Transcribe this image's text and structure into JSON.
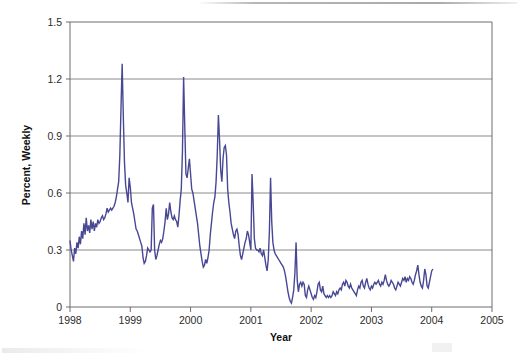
{
  "chart_data": {
    "type": "line",
    "title": "",
    "xlabel": "Year",
    "ylabel": "Percent, Weekly",
    "xlim": [
      1998.0,
      2005.0
    ],
    "ylim": [
      0,
      1.5
    ],
    "xticks": [
      1998,
      1999,
      2000,
      2001,
      2002,
      2003,
      2004,
      2005
    ],
    "xtick_labels": [
      "1998",
      "1999",
      "2000",
      "2001",
      "2002",
      "2003",
      "2004",
      "2005"
    ],
    "yticks": [
      0,
      0.3,
      0.6,
      0.9,
      1.2,
      1.5
    ],
    "ytick_labels": [
      "0",
      "0.3",
      "0.6",
      "0.9",
      "1.2",
      "1.5"
    ],
    "grid": "horizontal",
    "legend": "none",
    "series": [
      {
        "name": "Percent, Weekly",
        "color": "#474794",
        "x_start": 1998.0,
        "x_step": 0.019230769,
        "values": [
          0.35,
          0.3,
          0.27,
          0.24,
          0.31,
          0.28,
          0.34,
          0.31,
          0.37,
          0.33,
          0.4,
          0.36,
          0.44,
          0.38,
          0.47,
          0.4,
          0.43,
          0.39,
          0.46,
          0.41,
          0.45,
          0.4,
          0.44,
          0.42,
          0.46,
          0.44,
          0.45,
          0.47,
          0.48,
          0.46,
          0.47,
          0.49,
          0.52,
          0.5,
          0.51,
          0.52,
          0.51,
          0.52,
          0.53,
          0.55,
          0.58,
          0.62,
          0.66,
          0.8,
          1.05,
          1.28,
          1.0,
          0.76,
          0.64,
          0.6,
          0.55,
          0.68,
          0.63,
          0.55,
          0.52,
          0.49,
          0.45,
          0.41,
          0.4,
          0.38,
          0.36,
          0.34,
          0.32,
          0.26,
          0.23,
          0.24,
          0.27,
          0.31,
          0.3,
          0.29,
          0.3,
          0.52,
          0.54,
          0.3,
          0.25,
          0.27,
          0.3,
          0.33,
          0.35,
          0.34,
          0.36,
          0.4,
          0.45,
          0.52,
          0.46,
          0.49,
          0.55,
          0.5,
          0.47,
          0.46,
          0.48,
          0.46,
          0.45,
          0.42,
          0.48,
          0.56,
          0.62,
          0.82,
          1.21,
          0.95,
          0.7,
          0.68,
          0.73,
          0.78,
          0.7,
          0.62,
          0.6,
          0.56,
          0.52,
          0.48,
          0.44,
          0.38,
          0.32,
          0.28,
          0.24,
          0.21,
          0.22,
          0.25,
          0.23,
          0.26,
          0.3,
          0.38,
          0.44,
          0.5,
          0.55,
          0.58,
          0.66,
          0.8,
          1.01,
          0.88,
          0.72,
          0.66,
          0.78,
          0.84,
          0.85,
          0.8,
          0.62,
          0.55,
          0.5,
          0.44,
          0.41,
          0.38,
          0.36,
          0.4,
          0.41,
          0.38,
          0.32,
          0.27,
          0.25,
          0.28,
          0.31,
          0.34,
          0.36,
          0.4,
          0.38,
          0.34,
          0.3,
          0.7,
          0.55,
          0.36,
          0.31,
          0.3,
          0.3,
          0.29,
          0.31,
          0.28,
          0.27,
          0.3,
          0.26,
          0.22,
          0.19,
          0.25,
          0.4,
          0.68,
          0.45,
          0.34,
          0.3,
          0.28,
          0.27,
          0.26,
          0.25,
          0.24,
          0.23,
          0.22,
          0.21,
          0.19,
          0.16,
          0.12,
          0.08,
          0.05,
          0.03,
          0.02,
          0.05,
          0.09,
          0.18,
          0.34,
          0.14,
          0.08,
          0.12,
          0.13,
          0.11,
          0.13,
          0.12,
          0.06,
          0.05,
          0.09,
          0.11,
          0.09,
          0.07,
          0.05,
          0.04,
          0.06,
          0.05,
          0.08,
          0.12,
          0.13,
          0.09,
          0.08,
          0.11,
          0.07,
          0.06,
          0.05,
          0.06,
          0.05,
          0.06,
          0.05,
          0.06,
          0.08,
          0.07,
          0.06,
          0.08,
          0.07,
          0.09,
          0.1,
          0.09,
          0.12,
          0.13,
          0.11,
          0.14,
          0.13,
          0.11,
          0.1,
          0.12,
          0.1,
          0.09,
          0.08,
          0.07,
          0.06,
          0.09,
          0.11,
          0.1,
          0.13,
          0.14,
          0.11,
          0.1,
          0.13,
          0.15,
          0.12,
          0.1,
          0.09,
          0.11,
          0.1,
          0.12,
          0.13,
          0.12,
          0.13,
          0.14,
          0.12,
          0.11,
          0.13,
          0.12,
          0.14,
          0.17,
          0.14,
          0.12,
          0.11,
          0.12,
          0.14,
          0.13,
          0.12,
          0.1,
          0.09,
          0.11,
          0.13,
          0.12,
          0.11,
          0.13,
          0.15,
          0.14,
          0.16,
          0.13,
          0.15,
          0.14,
          0.16,
          0.15,
          0.13,
          0.12,
          0.14,
          0.17,
          0.19,
          0.22,
          0.17,
          0.13,
          0.11,
          0.1,
          0.14,
          0.2,
          0.17,
          0.11,
          0.1,
          0.13,
          0.16,
          0.19,
          0.2
        ]
      }
    ]
  },
  "plot_geometry": {
    "left": 70,
    "top": 22,
    "right": 492,
    "bottom": 307
  }
}
